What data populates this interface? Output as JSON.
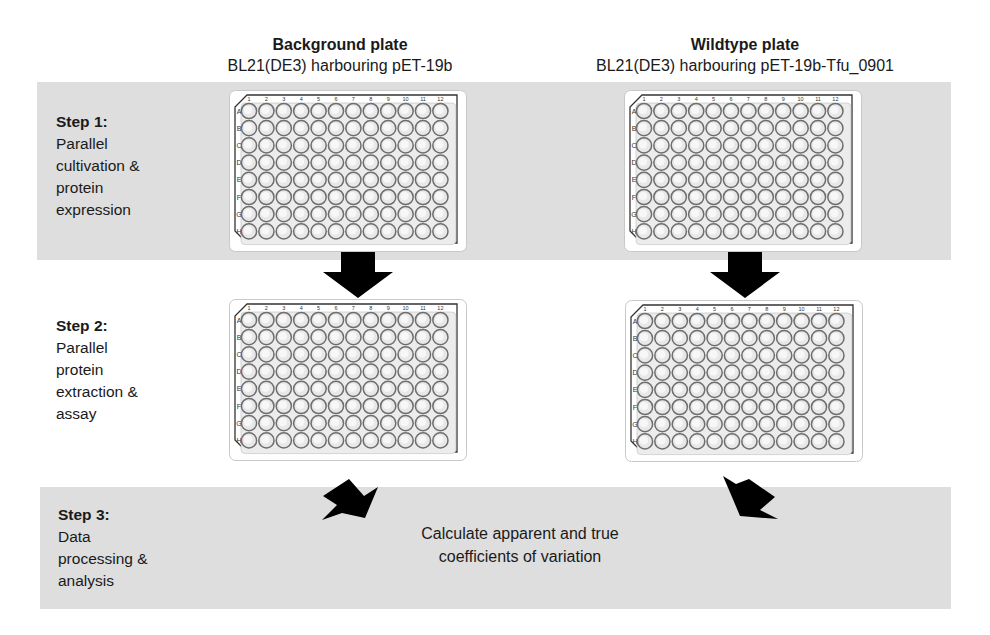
{
  "columns": [
    {
      "title": "Background plate",
      "subtitle": "BL21(DE3) harbouring pET-19b"
    },
    {
      "title": "Wildtype plate",
      "subtitle": "BL21(DE3) harbouring pET-19b-Tfu_0901"
    }
  ],
  "steps": [
    {
      "title": "Step 1:",
      "lines": [
        "Parallel",
        "cultivation &",
        "protein",
        "expression"
      ]
    },
    {
      "title": "Step 2:",
      "lines": [
        "Parallel",
        "protein",
        "extraction &",
        "assay"
      ]
    },
    {
      "title": "Step 3:",
      "lines": [
        "Data",
        "processing &",
        "analysis"
      ]
    }
  ],
  "plate": {
    "format": "96-well",
    "column_labels": [
      "1",
      "2",
      "3",
      "4",
      "5",
      "6",
      "7",
      "8",
      "9",
      "10",
      "11",
      "12"
    ],
    "row_labels": [
      "A",
      "B",
      "C",
      "D",
      "E",
      "F",
      "G",
      "H"
    ]
  },
  "result": {
    "lines": [
      "Calculate apparent and true",
      "coefficients of variation"
    ]
  },
  "colors": {
    "band": "#dedede",
    "arrow": "#000000",
    "well_stroke": "#6e6e6e",
    "well_fill": "#e8e8e8"
  }
}
